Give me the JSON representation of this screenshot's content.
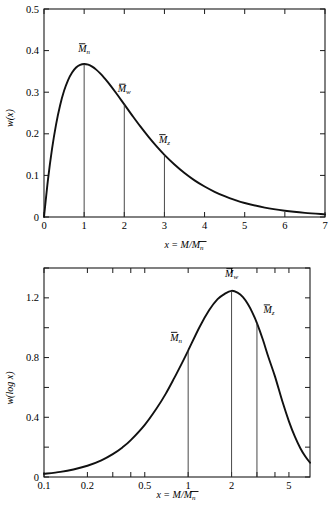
{
  "figure": {
    "title": "",
    "panel_count": 2
  },
  "chart_data": [
    {
      "type": "line",
      "id": "linear-distribution",
      "title": "",
      "xlabel": "x = M/M̅n",
      "ylabel": "w(x)",
      "xlabel_parts": {
        "lead": "x",
        "eq": "=",
        "num": "M",
        "den": "M",
        "den_sub": "n"
      },
      "ylabel_parts": {
        "fn": "w",
        "arg": "x"
      },
      "xlim": [
        0,
        7
      ],
      "ylim": [
        0,
        0.5
      ],
      "xticks": [
        0,
        1,
        2,
        3,
        4,
        5,
        6,
        7
      ],
      "xticklabels": [
        "0",
        "1",
        "2",
        "3",
        "4",
        "5",
        "6",
        "7"
      ],
      "yticks": [
        0,
        0.1,
        0.2,
        0.3,
        0.4,
        0.5
      ],
      "yticklabels": [
        "0",
        "0.1",
        "0.2",
        "0.3",
        "0.4",
        "0.5"
      ],
      "grid": false,
      "legend": "none",
      "x": [
        0,
        0.1,
        0.2,
        0.3,
        0.4,
        0.5,
        0.6,
        0.7,
        0.8,
        0.9,
        1.0,
        1.1,
        1.2,
        1.3,
        1.4,
        1.5,
        1.6,
        1.8,
        2.0,
        2.2,
        2.4,
        2.6,
        2.8,
        3.0,
        3.25,
        3.5,
        3.75,
        4.0,
        4.25,
        4.5,
        4.75,
        5.0,
        5.5,
        6.0,
        6.5,
        7.0
      ],
      "values": [
        0,
        0.0905,
        0.1637,
        0.2222,
        0.2681,
        0.3033,
        0.3293,
        0.3476,
        0.3595,
        0.3659,
        0.3679,
        0.3662,
        0.3614,
        0.3543,
        0.3452,
        0.3347,
        0.323,
        0.2975,
        0.2707,
        0.2438,
        0.2177,
        0.1932,
        0.1703,
        0.1494,
        0.1262,
        0.1057,
        0.0881,
        0.0733,
        0.0606,
        0.05,
        0.0411,
        0.0337,
        0.0224,
        0.0149,
        0.0098,
        0.0064
      ],
      "annotations": [
        {
          "label": "M̅n",
          "base": "M",
          "sub": "n",
          "x": 1.0,
          "y": 0.3679
        },
        {
          "label": "M̅w",
          "base": "M",
          "sub": "w",
          "x": 2.0,
          "y": 0.2707
        },
        {
          "label": "M̅z",
          "base": "M",
          "sub": "z",
          "x": 3.0,
          "y": 0.1494
        }
      ]
    },
    {
      "type": "line",
      "id": "log-distribution",
      "title": "",
      "xlabel": "x = M/M̅n",
      "ylabel": "w(log x)",
      "xlabel_parts": {
        "lead": "x",
        "eq": "=",
        "num": "M",
        "den": "M",
        "den_sub": "n"
      },
      "ylabel_parts": {
        "fn": "w",
        "arg": "log x"
      },
      "xscale": "log",
      "xlim": [
        0.1,
        7
      ],
      "ylim": [
        0,
        1.4
      ],
      "xticks": [
        0.1,
        0.2,
        0.5,
        1,
        2,
        5
      ],
      "xticklabels": [
        "0.1",
        "0.2",
        "0.5",
        "1",
        "2",
        "5"
      ],
      "yticks": [
        0,
        0.4,
        0.8,
        1.2
      ],
      "yticklabels": [
        "0",
        "0.4",
        "0.8",
        "1.2"
      ],
      "yminorticks": [
        0.2,
        0.6,
        1.0,
        1.4
      ],
      "grid": false,
      "legend": "none",
      "x": [
        0.1,
        0.13,
        0.16,
        0.2,
        0.25,
        0.3,
        0.35,
        0.4,
        0.5,
        0.6,
        0.7,
        0.8,
        0.9,
        1.0,
        1.2,
        1.4,
        1.6,
        1.8,
        2.0,
        2.2,
        2.4,
        2.6,
        2.8,
        3.0,
        3.3,
        3.6,
        4.0,
        4.5,
        5.0,
        5.5,
        6.0,
        6.5,
        7.0
      ],
      "values": [
        0.0208,
        0.0342,
        0.0503,
        0.0754,
        0.1121,
        0.1535,
        0.1983,
        0.247,
        0.3494,
        0.455,
        0.5585,
        0.662,
        0.758,
        0.847,
        1.005,
        1.118,
        1.191,
        1.228,
        1.247,
        1.235,
        1.205,
        1.157,
        1.098,
        1.031,
        0.919,
        0.804,
        0.674,
        0.507,
        0.373,
        0.27,
        0.193,
        0.137,
        0.096
      ],
      "annotations": [
        {
          "label": "M̅n",
          "base": "M",
          "sub": "n",
          "x": 1.0,
          "y": 0.847
        },
        {
          "label": "M̅w",
          "base": "M",
          "sub": "w",
          "x": 2.0,
          "y": 1.247
        },
        {
          "label": "M̅z",
          "base": "M",
          "sub": "z",
          "x": 3.0,
          "y": 1.031
        }
      ]
    }
  ],
  "colors": {
    "curve": "#111111",
    "axis": "#1a1a1a",
    "dropline": "#333333",
    "background": "#ffffff"
  }
}
